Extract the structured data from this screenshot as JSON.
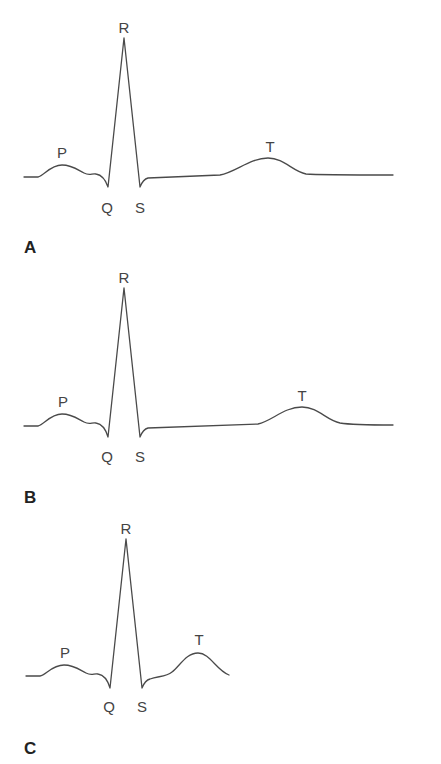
{
  "figure": {
    "colors": {
      "trace": "#4a4a4a",
      "label": "#444444",
      "panel_label": "#222222",
      "background": "#ffffff"
    },
    "panels": [
      {
        "id": "A",
        "panel_label": "A",
        "wave_labels": {
          "P": "P",
          "Q": "Q",
          "R": "R",
          "S": "S",
          "T": "T"
        },
        "description": "Normal ECG complex with long flat ST segment and broad T wave far to the right"
      },
      {
        "id": "B",
        "panel_label": "B",
        "wave_labels": {
          "P": "P",
          "Q": "Q",
          "R": "R",
          "S": "S",
          "T": "T"
        },
        "description": "ECG complex with even longer ST segment; T wave displaced further right"
      },
      {
        "id": "C",
        "panel_label": "C",
        "wave_labels": {
          "P": "P",
          "Q": "Q",
          "R": "R",
          "S": "S",
          "T": "T"
        },
        "description": "ECG complex with short ST segment; T wave close after S"
      }
    ]
  }
}
